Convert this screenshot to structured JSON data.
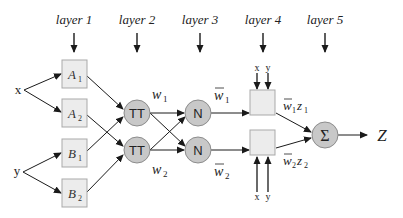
{
  "diagram": {
    "layers": [
      {
        "label": "layer 1",
        "x": 74
      },
      {
        "label": "layer 2",
        "x": 137
      },
      {
        "label": "layer 3",
        "x": 200
      },
      {
        "label": "layer 4",
        "x": 263
      },
      {
        "label": "layer 5",
        "x": 325
      }
    ],
    "inputs": {
      "x": "x",
      "y": "y"
    },
    "layer1_nodes": [
      {
        "label": "A",
        "sub": "1"
      },
      {
        "label": "A",
        "sub": "2"
      },
      {
        "label": "B",
        "sub": "1"
      },
      {
        "label": "B",
        "sub": "2"
      }
    ],
    "layer2_nodes": [
      {
        "label": "TT",
        "weight": "w",
        "weight_sub": "1"
      },
      {
        "label": "TT",
        "weight": "w",
        "weight_sub": "2"
      }
    ],
    "layer3_nodes": [
      {
        "label": "N",
        "weight": "w",
        "weight_sub": "1"
      },
      {
        "label": "N",
        "weight": "w",
        "weight_sub": "2"
      }
    ],
    "layer4_nodes": [
      {
        "inputs": [
          "x",
          "y"
        ],
        "output": "w",
        "output_sub": "1",
        "z": "z",
        "z_sub": "1"
      },
      {
        "inputs": [
          "x",
          "y"
        ],
        "output": "w",
        "output_sub": "2",
        "z": "z",
        "z_sub": "2"
      }
    ],
    "layer5_node": {
      "label": "Σ"
    },
    "output": {
      "label": "Z"
    },
    "colors": {
      "box_fill": "#ececec",
      "box_stroke": "#a9a9a9",
      "circle_fill": "#c8c8c8",
      "circle_stroke": "#8c8c8c",
      "line": "#1a1a1a",
      "text": "#222222"
    }
  }
}
